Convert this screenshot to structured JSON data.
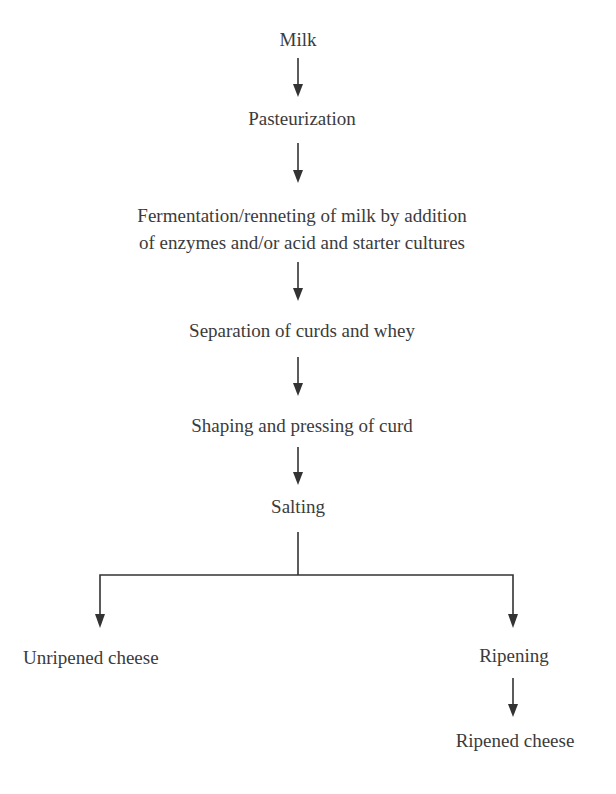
{
  "diagram": {
    "type": "flowchart",
    "direction": "top-to-bottom",
    "nodes": {
      "milk": "Milk",
      "pasteurization": "Pasteurization",
      "fermentation_line1": "Fermentation/renneting of milk by addition",
      "fermentation_line2": "of enzymes and/or acid and starter cultures",
      "separation": "Separation of curds and whey",
      "shaping": "Shaping and pressing of curd",
      "salting": "Salting",
      "unripened": "Unripened cheese",
      "ripening": "Ripening",
      "ripened": "Ripened cheese"
    },
    "edges": [
      {
        "from": "Milk",
        "to": "Pasteurization"
      },
      {
        "from": "Pasteurization",
        "to": "Fermentation/renneting of milk by addition of enzymes and/or acid and starter cultures"
      },
      {
        "from": "Fermentation/renneting of milk by addition of enzymes and/or acid and starter cultures",
        "to": "Separation of curds and whey"
      },
      {
        "from": "Separation of curds and whey",
        "to": "Shaping and pressing of curd"
      },
      {
        "from": "Shaping and pressing of curd",
        "to": "Salting"
      },
      {
        "from": "Salting",
        "to": "Unripened cheese"
      },
      {
        "from": "Salting",
        "to": "Ripening"
      },
      {
        "from": "Ripening",
        "to": "Ripened cheese"
      }
    ],
    "colors": {
      "background": "#ffffff",
      "text": "#3b3b3b",
      "line": "#333333"
    }
  }
}
